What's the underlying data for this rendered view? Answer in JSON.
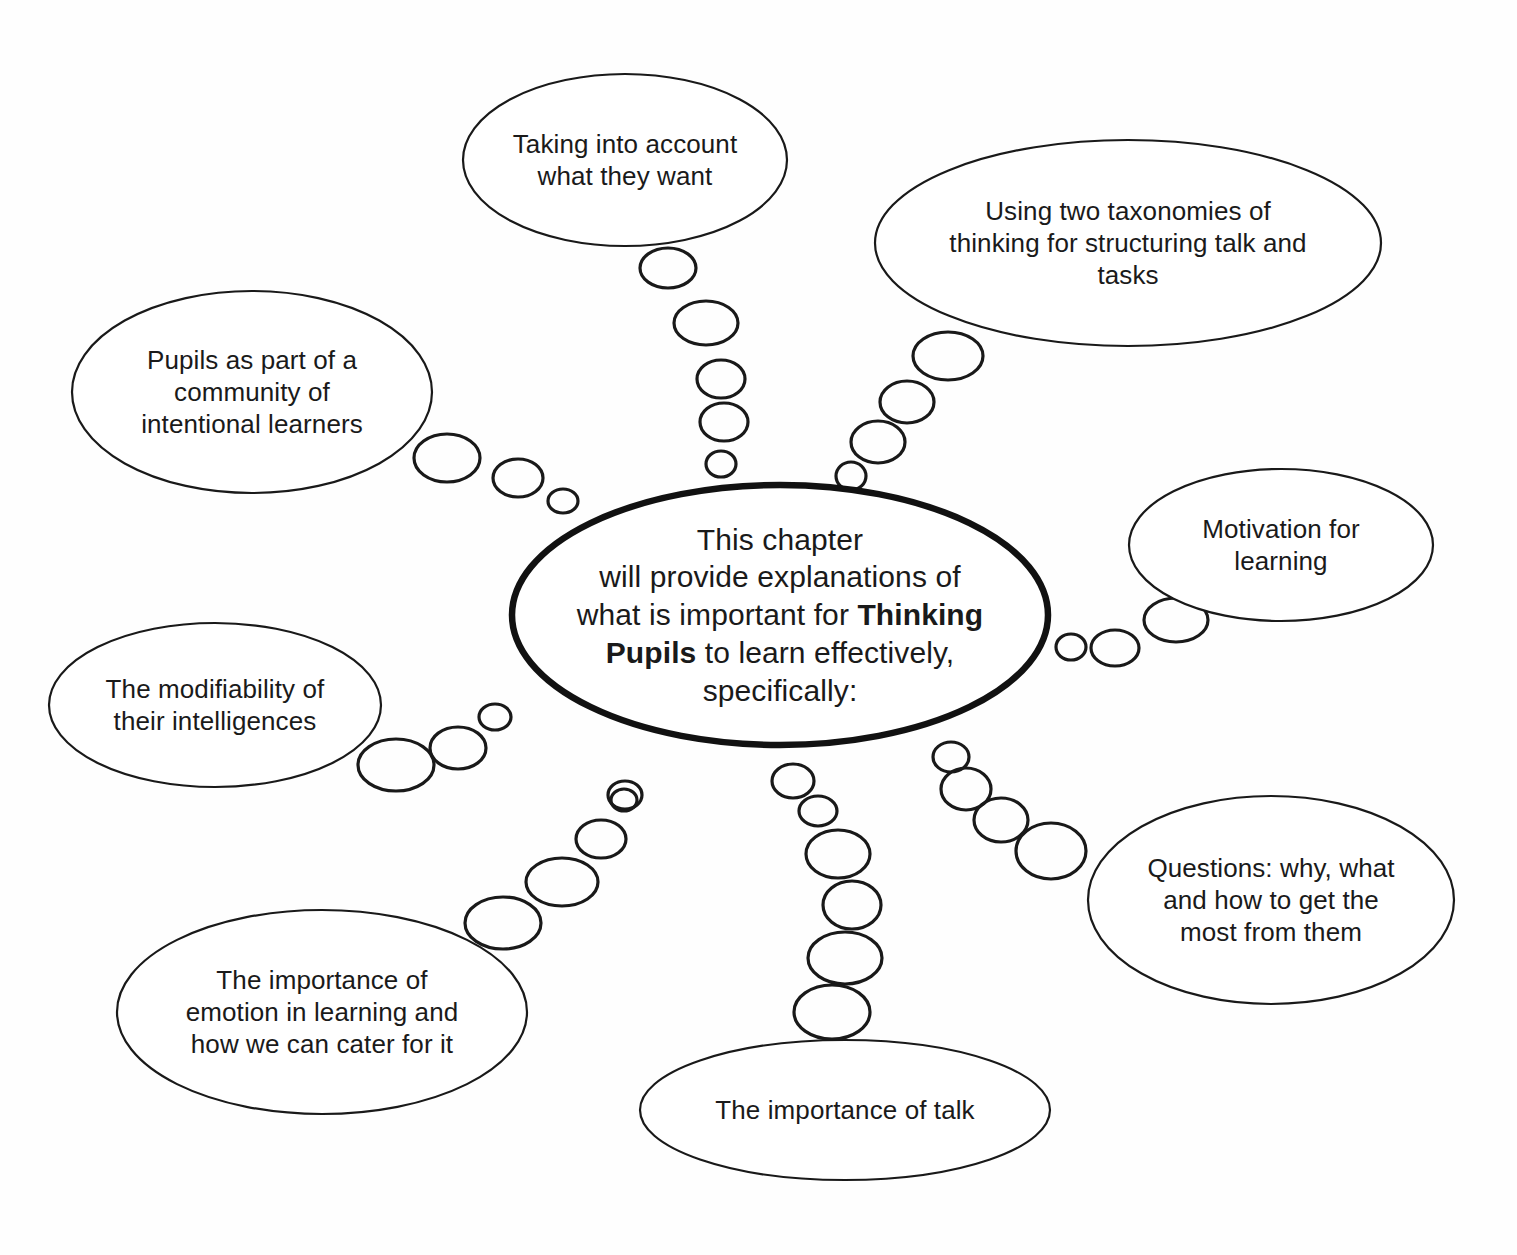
{
  "diagram": {
    "type": "mind-map",
    "background_color": "#fefefe",
    "line_color": "#191919",
    "central": {
      "name": "central-node",
      "line1": "This chapter",
      "line2": "will provide explanations of",
      "line3_a": "what is important for ",
      "line3_b": "Thinking",
      "line4_a": "Pupils",
      "line4_b": " to learn effectively,",
      "line5": "specifically:",
      "plain_text": "This chapter will provide explanations of what is important for Thinking Pupils to learn effectively, specifically:",
      "cx": 780,
      "cy": 615,
      "rx": 268,
      "ry": 130
    },
    "branches": [
      {
        "id": "taking-into-account",
        "label": "Taking into account what they want",
        "lines": [
          "Taking into account",
          "what they want"
        ],
        "cx": 625,
        "cy": 160,
        "rx": 162,
        "ry": 86,
        "trail_bubble_count": 5
      },
      {
        "id": "two-taxonomies",
        "label": "Using two taxonomies of thinking for structuring talk and tasks",
        "lines": [
          "Using two taxonomies of",
          "thinking for structuring talk and",
          "tasks"
        ],
        "cx": 1128,
        "cy": 243,
        "rx": 253,
        "ry": 103,
        "trail_bubble_count": 4
      },
      {
        "id": "community-of-learners",
        "label": "Pupils as part of a community of intentional learners",
        "lines": [
          "Pupils as part of a",
          "community of",
          "intentional learners"
        ],
        "cx": 252,
        "cy": 392,
        "rx": 180,
        "ry": 101,
        "trail_bubble_count": 3
      },
      {
        "id": "motivation-for-learning",
        "label": "Motivation for learning",
        "lines": [
          "Motivation for",
          "learning"
        ],
        "cx": 1281,
        "cy": 545,
        "rx": 152,
        "ry": 76,
        "trail_bubble_count": 3
      },
      {
        "id": "modifiability-intelligences",
        "label": "The modifiability of their intelligences",
        "lines": [
          "The modifiability of",
          "their intelligences"
        ],
        "cx": 215,
        "cy": 705,
        "rx": 166,
        "ry": 82,
        "trail_bubble_count": 3
      },
      {
        "id": "questions-why-what-how",
        "label": "Questions: why, what and how to get the most from them",
        "lines": [
          "Questions: why, what",
          "and how to get the",
          "most from them"
        ],
        "cx": 1271,
        "cy": 900,
        "rx": 183,
        "ry": 104,
        "trail_bubble_count": 4
      },
      {
        "id": "importance-of-emotion",
        "label": "The importance of emotion in learning and how we can cater for it",
        "lines": [
          "The importance of",
          "emotion in learning and",
          "how we can cater for it"
        ],
        "cx": 322,
        "cy": 1012,
        "rx": 205,
        "ry": 102,
        "trail_bubble_count": 5
      },
      {
        "id": "importance-of-talk",
        "label": "The importance of talk",
        "lines": [
          "The importance of talk"
        ],
        "cx": 845,
        "cy": 1110,
        "rx": 205,
        "ry": 70,
        "trail_bubble_count": 6
      }
    ],
    "trails": {
      "taking-into-account": [
        {
          "cx": 668,
          "cy": 268,
          "rx": 28,
          "ry": 20
        },
        {
          "cx": 706,
          "cy": 323,
          "rx": 32,
          "ry": 22
        },
        {
          "cx": 721,
          "cy": 379,
          "rx": 24,
          "ry": 19
        },
        {
          "cx": 724,
          "cy": 422,
          "rx": 24,
          "ry": 19
        },
        {
          "cx": 721,
          "cy": 464,
          "rx": 15,
          "ry": 13
        }
      ],
      "two-taxonomies": [
        {
          "cx": 948,
          "cy": 356,
          "rx": 35,
          "ry": 24
        },
        {
          "cx": 907,
          "cy": 402,
          "rx": 27,
          "ry": 21
        },
        {
          "cx": 878,
          "cy": 442,
          "rx": 27,
          "ry": 21
        },
        {
          "cx": 851,
          "cy": 476,
          "rx": 15,
          "ry": 14
        }
      ],
      "community-of-learners": [
        {
          "cx": 447,
          "cy": 458,
          "rx": 33,
          "ry": 24
        },
        {
          "cx": 518,
          "cy": 478,
          "rx": 25,
          "ry": 19
        },
        {
          "cx": 563,
          "cy": 501,
          "rx": 15,
          "ry": 12
        }
      ],
      "motivation-for-learning": [
        {
          "cx": 1176,
          "cy": 620,
          "rx": 32,
          "ry": 22
        },
        {
          "cx": 1115,
          "cy": 648,
          "rx": 24,
          "ry": 18
        },
        {
          "cx": 1071,
          "cy": 647,
          "rx": 15,
          "ry": 13
        }
      ],
      "modifiability-intelligences": [
        {
          "cx": 396,
          "cy": 765,
          "rx": 38,
          "ry": 26
        },
        {
          "cx": 458,
          "cy": 748,
          "rx": 28,
          "ry": 21
        },
        {
          "cx": 495,
          "cy": 717,
          "rx": 16,
          "ry": 13
        }
      ],
      "questions-why-what-how": [
        {
          "cx": 951,
          "cy": 757,
          "rx": 18,
          "ry": 15
        },
        {
          "cx": 966,
          "cy": 789,
          "rx": 25,
          "ry": 21
        },
        {
          "cx": 1001,
          "cy": 820,
          "rx": 27,
          "ry": 22
        },
        {
          "cx": 1051,
          "cy": 851,
          "rx": 35,
          "ry": 28
        }
      ],
      "importance-of-emotion": [
        {
          "cx": 625,
          "cy": 795,
          "rx": 17,
          "ry": 14
        },
        {
          "cx": 624,
          "cy": 800,
          "rx": 13,
          "ry": 11
        },
        {
          "cx": 601,
          "cy": 839,
          "rx": 25,
          "ry": 19
        },
        {
          "cx": 562,
          "cy": 882,
          "rx": 36,
          "ry": 24
        },
        {
          "cx": 503,
          "cy": 923,
          "rx": 38,
          "ry": 26
        }
      ],
      "importance-of-talk": [
        {
          "cx": 793,
          "cy": 781,
          "rx": 21,
          "ry": 17
        },
        {
          "cx": 818,
          "cy": 811,
          "rx": 19,
          "ry": 15
        },
        {
          "cx": 838,
          "cy": 854,
          "rx": 32,
          "ry": 24
        },
        {
          "cx": 852,
          "cy": 905,
          "rx": 29,
          "ry": 24
        },
        {
          "cx": 845,
          "cy": 958,
          "rx": 37,
          "ry": 26
        },
        {
          "cx": 832,
          "cy": 1012,
          "rx": 38,
          "ry": 27
        }
      ]
    }
  }
}
